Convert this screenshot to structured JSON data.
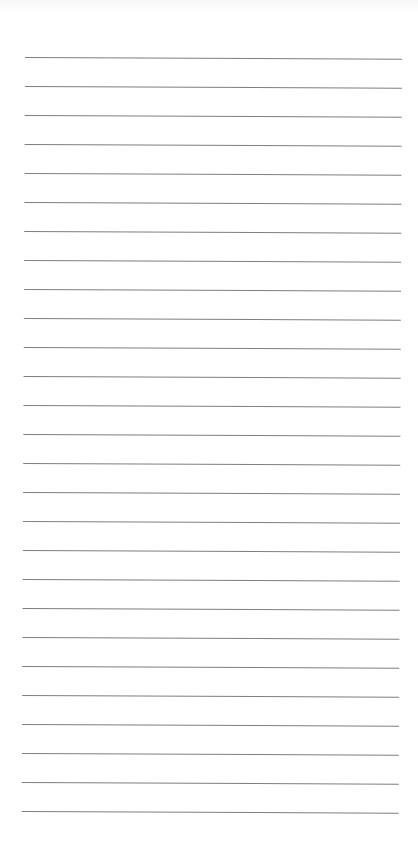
{
  "page": {
    "type": "lined-paper",
    "background_color": "#ffffff",
    "line_color": "#707070",
    "line_count": 27,
    "line_spacing_px": 29
  }
}
